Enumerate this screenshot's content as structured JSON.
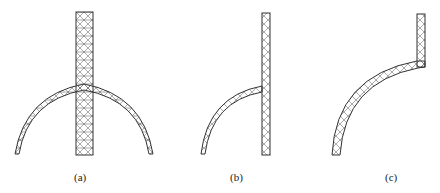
{
  "figure": {
    "panels": [
      {
        "id": "a",
        "label": "(a)",
        "description": "Full arch crossing a vertical column, triangular finite-element mesh"
      },
      {
        "id": "b",
        "label": "(b)",
        "description": "Half arch meeting a vertical column on its right, mesh"
      },
      {
        "id": "c",
        "label": "(c)",
        "description": "Quarter arch joined to a short vertical column at upper right, mesh"
      }
    ]
  },
  "colors": {
    "line": "#333333",
    "background": "#ffffff"
  }
}
